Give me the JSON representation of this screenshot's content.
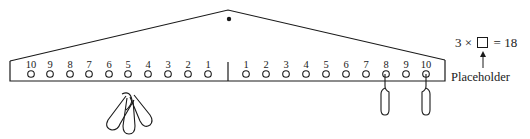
{
  "diagram": {
    "type": "number balance / equalizer",
    "left_arm_labels": [
      "10",
      "9",
      "8",
      "7",
      "6",
      "5",
      "4",
      "3",
      "2",
      "1"
    ],
    "right_arm_labels": [
      "1",
      "2",
      "3",
      "4",
      "5",
      "6",
      "7",
      "8",
      "9",
      "10"
    ],
    "left_weights": {
      "peg": "5",
      "count": 3
    },
    "right_weights": [
      {
        "peg": "8",
        "count": 1
      },
      {
        "peg": "10",
        "count": 1
      }
    ]
  },
  "equation": {
    "left": "3",
    "operator": "×",
    "equals": "=",
    "right": "18",
    "placeholder_label": "Placeholder"
  }
}
